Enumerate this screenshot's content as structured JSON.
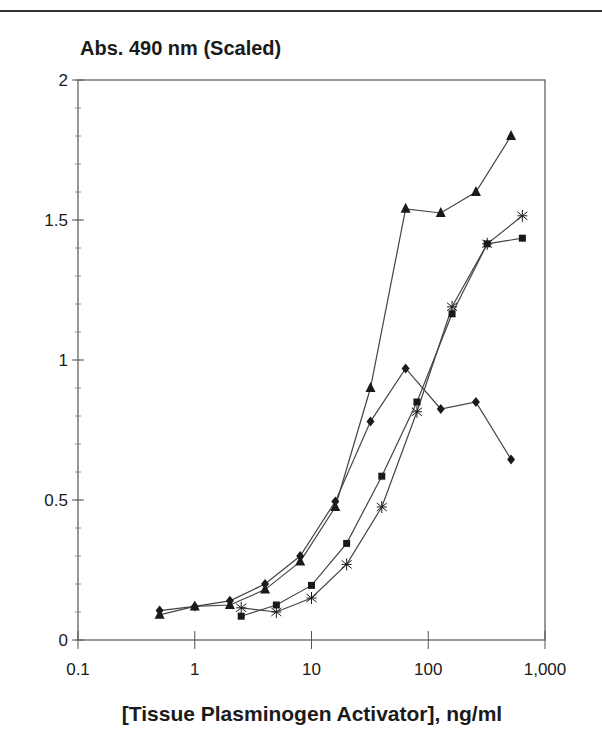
{
  "chart_data": {
    "type": "line",
    "title": "",
    "ylabel": "Abs. 490 nm (Scaled)",
    "xlabel": "[Tissue Plasminogen Activator], ng/ml",
    "xscale": "log",
    "xlim": [
      0.1,
      1000
    ],
    "ylim": [
      0,
      2
    ],
    "x_ticks": [
      "0.1",
      "1",
      "10",
      "100",
      "1,000"
    ],
    "y_ticks": [
      "0",
      "0.5",
      "1",
      "1.5",
      "2"
    ],
    "y_minor_step": 0.1,
    "grid": false,
    "legend": null,
    "series": [
      {
        "name": "triangle",
        "marker": "triangle",
        "x": [
          0.5,
          1,
          2,
          4,
          8,
          16,
          32,
          64,
          128,
          256,
          512
        ],
        "values": [
          0.09,
          0.12,
          0.125,
          0.18,
          0.28,
          0.475,
          0.9,
          1.54,
          1.525,
          1.6,
          1.8
        ]
      },
      {
        "name": "diamond",
        "marker": "diamond",
        "x": [
          0.5,
          1,
          2,
          4,
          8,
          16,
          32,
          64,
          128,
          256,
          512
        ],
        "values": [
          0.105,
          0.12,
          0.14,
          0.2,
          0.3,
          0.495,
          0.78,
          0.97,
          0.825,
          0.85,
          0.645
        ]
      },
      {
        "name": "square",
        "marker": "square",
        "x": [
          2.5,
          5,
          10,
          20,
          40,
          80,
          160,
          320,
          640
        ],
        "values": [
          0.085,
          0.125,
          0.195,
          0.345,
          0.585,
          0.85,
          1.165,
          1.415,
          1.435
        ]
      },
      {
        "name": "star",
        "marker": "star",
        "x": [
          2.5,
          5,
          10,
          20,
          40,
          80,
          160,
          320,
          640
        ],
        "values": [
          0.115,
          0.1,
          0.15,
          0.27,
          0.475,
          0.815,
          1.19,
          1.415,
          1.515
        ]
      }
    ]
  },
  "colors": {
    "ink": "#1a1a1a",
    "line": "#444444",
    "background": "#ffffff"
  }
}
